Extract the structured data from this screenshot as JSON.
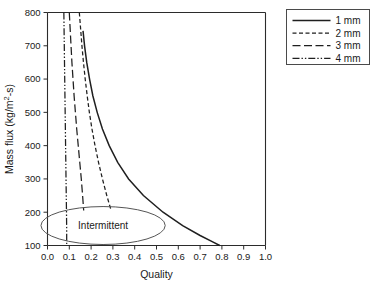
{
  "chart_data": {
    "type": "line",
    "title": "",
    "xlabel": "Quality",
    "ylabel": "Mass flux (kg/m2-s)",
    "ylabel_display": "Mass flux (kg/m²-s)",
    "xlim": [
      0.0,
      1.0
    ],
    "ylim": [
      100,
      800
    ],
    "xticks": [
      "0.0",
      "0.1",
      "0.2",
      "0.3",
      "0.4",
      "0.5",
      "0.6",
      "0.7",
      "0.8",
      "0.9",
      "1.0"
    ],
    "xtick_values": [
      0.0,
      0.1,
      0.2,
      0.3,
      0.4,
      0.5,
      0.6,
      0.7,
      0.8,
      0.9,
      1.0
    ],
    "yticks": [
      "100",
      "200",
      "300",
      "400",
      "500",
      "600",
      "700",
      "800"
    ],
    "ytick_values": [
      100,
      200,
      300,
      400,
      500,
      600,
      700,
      800
    ],
    "grid": false,
    "legend_position": "outside-top-right",
    "series": [
      {
        "name": "1 mm",
        "style": "solid",
        "dash": "none",
        "color": "#1f1f1f",
        "points": [
          [
            0.163,
            745
          ],
          [
            0.17,
            700
          ],
          [
            0.18,
            650
          ],
          [
            0.193,
            600
          ],
          [
            0.208,
            550
          ],
          [
            0.228,
            500
          ],
          [
            0.252,
            450
          ],
          [
            0.283,
            400
          ],
          [
            0.322,
            350
          ],
          [
            0.372,
            300
          ],
          [
            0.44,
            250
          ],
          [
            0.53,
            200
          ],
          [
            0.62,
            160
          ],
          [
            0.7,
            130
          ],
          [
            0.76,
            110
          ],
          [
            0.79,
            100
          ]
        ]
      },
      {
        "name": "2 mm",
        "style": "short-dash",
        "dash": "4,2.5",
        "color": "#1f1f1f",
        "points": [
          [
            0.146,
            800
          ],
          [
            0.152,
            750
          ],
          [
            0.158,
            700
          ],
          [
            0.165,
            650
          ],
          [
            0.173,
            600
          ],
          [
            0.182,
            550
          ],
          [
            0.192,
            500
          ],
          [
            0.204,
            450
          ],
          [
            0.218,
            400
          ],
          [
            0.234,
            350
          ],
          [
            0.252,
            300
          ],
          [
            0.272,
            250
          ],
          [
            0.292,
            205
          ]
        ]
      },
      {
        "name": "3 mm",
        "style": "long-dash",
        "dash": "8,3.5",
        "color": "#1f1f1f",
        "points": [
          [
            0.1,
            800
          ],
          [
            0.104,
            750
          ],
          [
            0.108,
            700
          ],
          [
            0.112,
            650
          ],
          [
            0.117,
            600
          ],
          [
            0.122,
            550
          ],
          [
            0.128,
            500
          ],
          [
            0.134,
            450
          ],
          [
            0.141,
            400
          ],
          [
            0.148,
            350
          ],
          [
            0.155,
            300
          ],
          [
            0.161,
            250
          ],
          [
            0.166,
            205
          ]
        ]
      },
      {
        "name": "4 mm",
        "style": "dash-dot-dot",
        "dash": "7,2,1.4,2,1.4,2",
        "color": "#1f1f1f",
        "points": [
          [
            0.075,
            800
          ],
          [
            0.076,
            750
          ],
          [
            0.077,
            700
          ],
          [
            0.078,
            650
          ],
          [
            0.079,
            600
          ],
          [
            0.08,
            550
          ],
          [
            0.081,
            500
          ],
          [
            0.082,
            450
          ],
          [
            0.083,
            400
          ],
          [
            0.084,
            350
          ],
          [
            0.085,
            300
          ],
          [
            0.086,
            250
          ],
          [
            0.087,
            205
          ],
          [
            0.088,
            150
          ],
          [
            0.088,
            100
          ]
        ]
      }
    ],
    "annotations": [
      {
        "name": "intermittent-region",
        "shape": "ellipse",
        "label": "Intermittent",
        "center_x": 0.255,
        "center_y": 160,
        "radius_x": 0.285,
        "radius_y": 57
      }
    ],
    "legend_entries": [
      {
        "label": "1 mm",
        "style": "solid"
      },
      {
        "label": "2 mm",
        "style": "short-dash"
      },
      {
        "label": "3 mm",
        "style": "long-dash"
      },
      {
        "label": "4 mm",
        "style": "dash-dot-dot"
      }
    ]
  }
}
